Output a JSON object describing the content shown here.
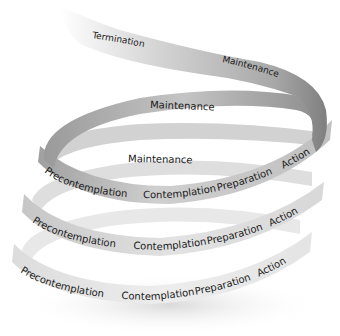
{
  "diagram": {
    "type": "spiral-ribbon",
    "colors": {
      "ribbon_dark": "#8a8a8a",
      "ribbon_mid": "#b5b5b5",
      "ribbon_light": "#e6e6e6",
      "text": "#1a1a1a",
      "background": "#ffffff"
    },
    "top_segment": {
      "labels": {
        "termination": "Termination",
        "maintenance": "Maintenance"
      }
    },
    "loops": [
      {
        "id": "loop1",
        "labels": {
          "back": "Maintenance"
        }
      },
      {
        "id": "loop2",
        "labels": {
          "back": "Maintenance",
          "precontemplation": "Precontemplation",
          "contemplation": "Contemplation",
          "preparation": "Preparation",
          "action": "Action"
        }
      },
      {
        "id": "loop3",
        "labels": {
          "precontemplation": "Precontemplation",
          "contemplation": "Contemplation",
          "preparation": "Preparation",
          "action": "Action"
        }
      },
      {
        "id": "loop4",
        "labels": {
          "precontemplation": "Precontemplation",
          "contemplation": "Contemplation",
          "preparation": "Preparation",
          "action": "Action"
        }
      }
    ]
  }
}
